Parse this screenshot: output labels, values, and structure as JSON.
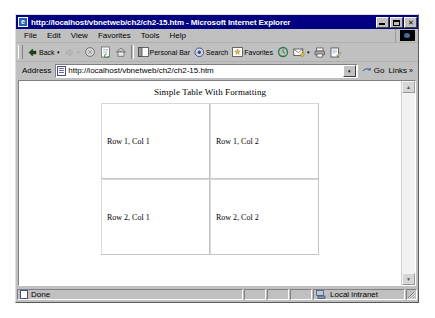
{
  "window": {
    "title": "http://localhost/vbnetweb/ch2/ch2-15.htm - Microsoft Internet Explorer",
    "icon_glyph": "e",
    "minimize_label": "Minimize",
    "maximize_label": "Maximize",
    "close_label": "✕"
  },
  "menu": {
    "items": [
      {
        "label": "File"
      },
      {
        "label": "Edit"
      },
      {
        "label": "View"
      },
      {
        "label": "Favorites"
      },
      {
        "label": "Tools"
      },
      {
        "label": "Help"
      }
    ]
  },
  "toolbar": {
    "back_label": "Back",
    "back_arrow": "▾",
    "forward_arrow": "▾",
    "personal_bar_label": "Personal Bar",
    "search_label": "Search",
    "favorites_label": "Favorites",
    "mail_arrow": "▾"
  },
  "address": {
    "label": "Address",
    "value": "http://localhost/vbnetweb/ch2/ch2-15.htm",
    "dropdown_glyph": "▾",
    "go_label": "Go",
    "links_label": "Links",
    "links_chevron": "»"
  },
  "page": {
    "heading": "Simple Table With Formatting",
    "table": {
      "rows": [
        [
          "Row 1, Col 1",
          "Row 1, Col 2"
        ],
        [
          "Row 2, Col 1",
          "Row 2, Col 2"
        ]
      ]
    }
  },
  "scrollbar": {
    "up_glyph": "▲",
    "down_glyph": "▼"
  },
  "status": {
    "message": "Done",
    "zone": "Local intranet"
  },
  "colors": {
    "titlebar": "#000080",
    "chrome": "#c0c0c0",
    "page_background": "#ffffff",
    "table_border": "#d0d0d0"
  }
}
